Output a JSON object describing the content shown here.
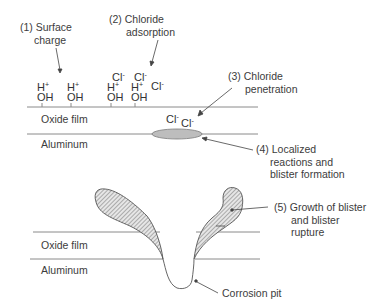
{
  "diagram": {
    "steps": [
      {
        "id": 1,
        "lines": [
          "(1) Surface",
          "charge"
        ]
      },
      {
        "id": 2,
        "lines": [
          "(2) Chloride",
          "adsorption"
        ]
      },
      {
        "id": 3,
        "lines": [
          "(3) Chloride",
          "penetration"
        ]
      },
      {
        "id": 4,
        "lines": [
          "(4) Localized",
          "reactions and",
          "blister formation"
        ]
      },
      {
        "id": 5,
        "lines": [
          "(5) Growth of blister",
          "and blister",
          "rupture"
        ]
      }
    ],
    "layers": {
      "top": {
        "oxide": "Oxide film",
        "metal": "Aluminum"
      },
      "bottom": {
        "oxide": "Oxide film",
        "metal": "Aluminum"
      }
    },
    "ions": {
      "h": "H",
      "oh": "OH",
      "cl": "Cl",
      "plus": "+",
      "minus": "-"
    },
    "pit_label": "Corrosion pit",
    "colors": {
      "line": "#8a8a8a",
      "blister_fill": "#bdbdbd",
      "hatch": "#6e6e6e",
      "text": "#3c3c3c"
    }
  }
}
